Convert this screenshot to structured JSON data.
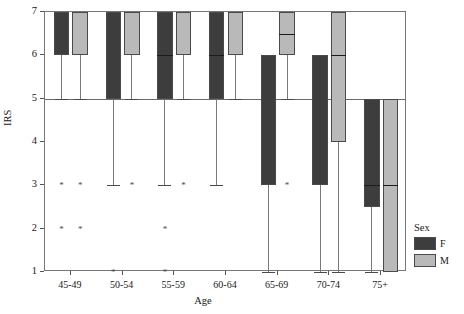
{
  "chart_data": {
    "type": "box",
    "title": "",
    "xlabel": "Age",
    "ylabel": "IRS",
    "ylim": [
      1,
      7
    ],
    "yticks": [
      1,
      2,
      3,
      4,
      5,
      6,
      7
    ],
    "ytick_labels": [
      "1",
      "2",
      "3",
      "4",
      "5",
      "6",
      "7"
    ],
    "grid": false,
    "reference_lines": [
      5
    ],
    "categories": [
      "45-49",
      "50-54",
      "55-59",
      "60-64",
      "65-69",
      "70-74",
      "75+"
    ],
    "legend": {
      "title": "Sex",
      "position": "right",
      "entries": [
        {
          "name": "F",
          "color": "#3d3d3d"
        },
        {
          "name": "M",
          "color": "#b9b9b9"
        }
      ]
    },
    "series": [
      {
        "name": "F",
        "color": "#3d3d3d",
        "boxes": [
          {
            "category": "45-49",
            "q1": 6,
            "median": 6,
            "q3": 7,
            "whisker_low": 5,
            "whisker_high": 7,
            "outliers": [
              3,
              2
            ]
          },
          {
            "category": "50-54",
            "q1": 5,
            "median": 7,
            "q3": 7,
            "whisker_low": 3,
            "whisker_high": 7,
            "outliers": [
              1
            ]
          },
          {
            "category": "55-59",
            "q1": 5,
            "median": 6,
            "q3": 7,
            "whisker_low": 3,
            "whisker_high": 7,
            "outliers": [
              2,
              1
            ]
          },
          {
            "category": "60-64",
            "q1": 5,
            "median": 6,
            "q3": 7,
            "whisker_low": 3,
            "whisker_high": 7,
            "outliers": []
          },
          {
            "category": "65-69",
            "q1": 3,
            "median": 6,
            "q3": 6,
            "whisker_low": 1,
            "whisker_high": 6,
            "outliers": []
          },
          {
            "category": "70-74",
            "q1": 3,
            "median": 6,
            "q3": 6,
            "whisker_low": 1,
            "whisker_high": 6,
            "outliers": []
          },
          {
            "category": "75+",
            "q1": 2.5,
            "median": 3,
            "q3": 5,
            "whisker_low": 1,
            "whisker_high": 5,
            "outliers": []
          }
        ]
      },
      {
        "name": "M",
        "color": "#b9b9b9",
        "boxes": [
          {
            "category": "45-49",
            "q1": 6,
            "median": 7,
            "q3": 7,
            "whisker_low": 5,
            "whisker_high": 7,
            "outliers": [
              3,
              2
            ]
          },
          {
            "category": "50-54",
            "q1": 6,
            "median": 7,
            "q3": 7,
            "whisker_low": 5,
            "whisker_high": 7,
            "outliers": [
              3
            ]
          },
          {
            "category": "55-59",
            "q1": 6,
            "median": 7,
            "q3": 7,
            "whisker_low": 5,
            "whisker_high": 7,
            "outliers": [
              3
            ]
          },
          {
            "category": "60-64",
            "q1": 6,
            "median": 7,
            "q3": 7,
            "whisker_low": 5,
            "whisker_high": 7,
            "outliers": []
          },
          {
            "category": "65-69",
            "q1": 6,
            "median": 6.5,
            "q3": 7,
            "whisker_low": 5,
            "whisker_high": 7,
            "outliers": [
              3
            ]
          },
          {
            "category": "70-74",
            "q1": 4,
            "median": 6,
            "q3": 7,
            "whisker_low": 1,
            "whisker_high": 7,
            "outliers": []
          },
          {
            "category": "75+",
            "q1": 1,
            "median": 3,
            "q3": 5,
            "whisker_low": 1,
            "whisker_high": 5,
            "outliers": []
          }
        ]
      }
    ],
    "outlier_marker": "*"
  }
}
